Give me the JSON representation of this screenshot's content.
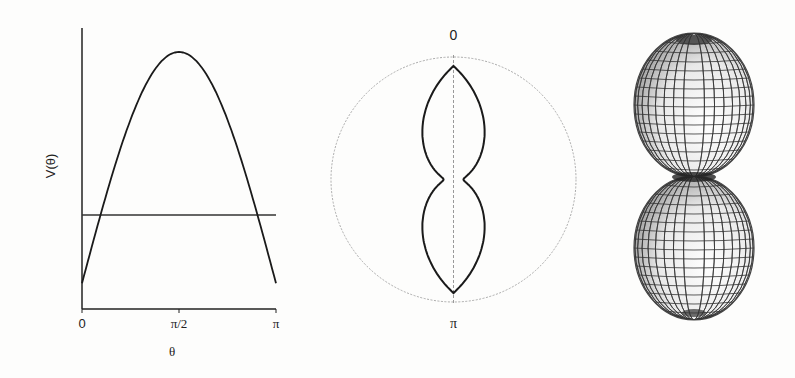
{
  "figure": {
    "panels": [
      {
        "id": "potential-plot",
        "type": "line",
        "ylabel": "V(θ)",
        "xlabel": "θ",
        "xticks": [
          "0",
          "π/2",
          "π"
        ]
      },
      {
        "id": "polar-plot",
        "type": "polar",
        "angle_labels": {
          "top": "0",
          "bottom": "π"
        }
      },
      {
        "id": "surface-3d",
        "type": "3d-surface",
        "description": "Two stacked lobes of revolution (wireframe shaded surface)"
      }
    ]
  },
  "chart_data": [
    {
      "type": "line",
      "title": "",
      "xlabel": "θ",
      "ylabel": "V(θ)",
      "xlim": [
        0,
        3.14159
      ],
      "xticks": [
        0,
        1.5708,
        3.14159
      ],
      "xtick_labels": [
        "0",
        "π/2",
        "π"
      ],
      "yticks": [],
      "grid": false,
      "series": [
        {
          "name": "V(θ)",
          "x": [
            0,
            0.314,
            0.628,
            0.942,
            1.257,
            1.571,
            1.885,
            2.199,
            2.513,
            2.827,
            3.142
          ],
          "y": [
            0.1,
            0.39,
            0.65,
            0.86,
            0.98,
            1.0,
            0.98,
            0.86,
            0.65,
            0.39,
            0.1
          ]
        },
        {
          "name": "energy level",
          "x": [
            0,
            3.142
          ],
          "y": [
            0.37,
            0.37
          ]
        }
      ]
    },
    {
      "type": "polar",
      "title": "",
      "angle_labels": [
        "0",
        "π"
      ],
      "series": [
        {
          "name": "r(θ)",
          "theta": [
            0,
            0.314,
            0.628,
            0.942,
            1.257,
            1.571,
            1.885,
            2.199,
            2.513,
            2.827,
            3.142
          ],
          "r": [
            0.92,
            0.64,
            0.38,
            0.18,
            0.1,
            0.08,
            0.1,
            0.18,
            0.38,
            0.64,
            0.92
          ]
        }
      ],
      "reference_circle_r": 1.0
    },
    {
      "type": "3d-surface",
      "title": "",
      "description": "Surface of revolution of the polar curve about the vertical axis: two egg-shaped lobes touching at the waist"
    }
  ]
}
